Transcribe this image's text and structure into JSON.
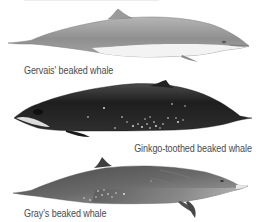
{
  "plate": {
    "background": "#ffffff",
    "whales": [
      {
        "name": "Gervais' beaked whale",
        "orientation": "facing-right",
        "colors": {
          "back": "#9a9a9a",
          "belly": "#f2f2f2",
          "outline": "#6e6e6e"
        }
      },
      {
        "name": "Ginkgo-toothed beaked whale",
        "orientation": "facing-left",
        "colors": {
          "back": "#2a2a2a",
          "belly": "#4a4a4a",
          "spots": "#e8e8e8",
          "face": "#d9d9d9"
        }
      },
      {
        "name": "Gray's beaked whale",
        "orientation": "facing-right",
        "colors": {
          "back": "#5c5c5c",
          "belly": "#9c9c9c",
          "beak": "#e6e6e6",
          "spots": "#e0e0e0"
        }
      }
    ]
  }
}
